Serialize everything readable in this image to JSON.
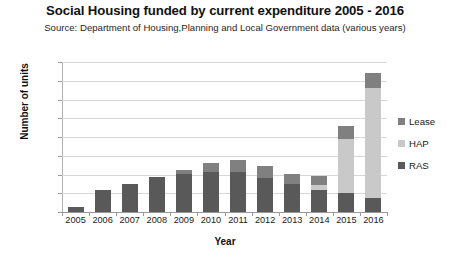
{
  "chart_data": {
    "type": "bar",
    "stacked": true,
    "title": "Social Housing funded by current expenditure 2005 - 2016",
    "subtitle": "Source: Department of Housing,Planning and Local Government data (various years)",
    "xlabel": "Year",
    "ylabel": "Number of units",
    "categories": [
      "2005",
      "2006",
      "2007",
      "2008",
      "2009",
      "2010",
      "2011",
      "2012",
      "2013",
      "2014",
      "2015",
      "2016"
    ],
    "series": [
      {
        "name": "RAS",
        "color": "#595959",
        "values": [
          500,
          2350,
          2950,
          3700,
          4100,
          4300,
          4250,
          3650,
          3000,
          2350,
          2000,
          1450
        ]
      },
      {
        "name": "HAP",
        "color": "#c9c9c9",
        "values": [
          0,
          0,
          0,
          0,
          0,
          0,
          0,
          0,
          0,
          500,
          5800,
          11800
        ]
      },
      {
        "name": "Lease",
        "color": "#808080",
        "values": [
          0,
          0,
          0,
          0,
          400,
          900,
          1250,
          1300,
          1100,
          1000,
          1350,
          1550
        ]
      }
    ],
    "totals": [
      500,
      2350,
      2950,
      3700,
      4500,
      5200,
      5500,
      4950,
      4100,
      3850,
      9150,
      14800
    ],
    "ylim": [
      0,
      16000
    ],
    "yticks": [
      0,
      2000,
      4000,
      6000,
      8000,
      10000,
      12000,
      14000,
      16000
    ],
    "ytick_labels": [
      "0",
      "2000",
      "4000",
      "6000",
      "8000",
      "10000",
      "12000",
      "14000",
      "16000"
    ],
    "grid": true,
    "legend_position": "right",
    "legend_order": [
      "Lease",
      "HAP",
      "RAS"
    ],
    "legend": [
      {
        "label": "Lease",
        "color": "#808080"
      },
      {
        "label": "HAP",
        "color": "#c9c9c9"
      },
      {
        "label": "RAS",
        "color": "#595959"
      }
    ],
    "background_color": "#ffffff",
    "grid_color": "#d6d6d6",
    "axis_color": "#9a9a9a"
  }
}
